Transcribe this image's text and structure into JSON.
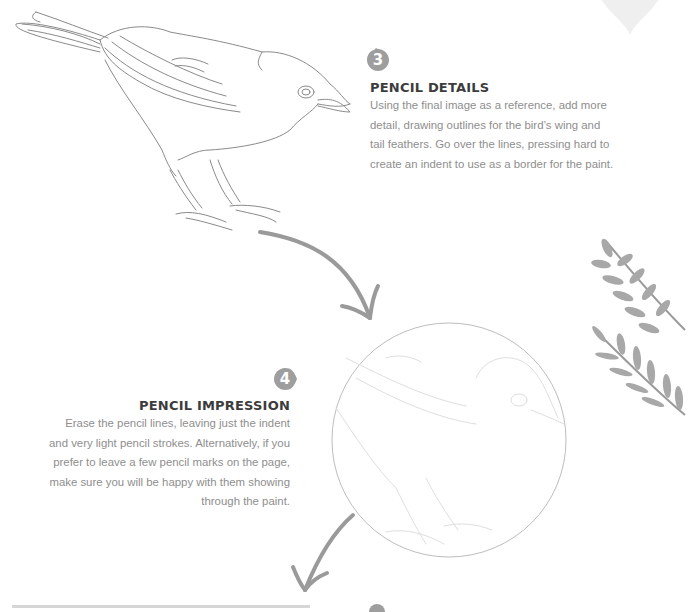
{
  "steps": [
    {
      "number": "3",
      "title": "PENCIL DETAILS",
      "body": "Using the final image as a reference, add more detail, drawing outlines for the bird’s wing and tail feathers. Go over the lines, pressing hard to create an indent to use as a border for the paint.",
      "lines": [
        "Using the final image as a reference, add more",
        "detail, drawing outlines for the bird’s wing and",
        "tail feathers. Go over the lines, pressing hard to",
        "create an indent to use as a border for the paint."
      ]
    },
    {
      "number": "4",
      "title": "PENCIL IMPRESSION",
      "body": "Erase the pencil lines, leaving just the indent and very light pencil strokes. Alternatively, if you prefer to leave a few pencil marks on the page, make sure you will be happy with them showing through the paint.",
      "lines": [
        "Erase the pencil lines, leaving just the indent",
        "and very light pencil strokes. Alternatively, if you",
        "prefer to leave a few pencil marks on the page,",
        "make sure you will be happy with them showing",
        "through the paint."
      ]
    }
  ],
  "illustrations": {
    "bird_sketch": "pencil-outline-bird",
    "bird_impression": "faint-bird-circle",
    "decor": [
      "heart-shape",
      "fern-leaves"
    ],
    "arrows": [
      "arrow-step3-to-4",
      "arrow-step4-to-5"
    ]
  },
  "colors": {
    "badge": "#9e9e9e",
    "heading": "#3c3c3c",
    "body": "#8e8e8e",
    "pencil": "#8a8a8a",
    "arrow": "#9a9a9a",
    "decor": "#ececec"
  }
}
